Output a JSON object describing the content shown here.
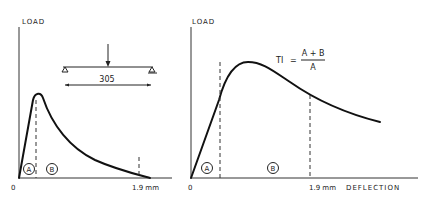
{
  "left_chart": {
    "y_label": "LOAD",
    "origin_label": "0",
    "x_tick_label": "1.9 mm",
    "region_a": "A",
    "region_b": "B",
    "beam": {
      "span_label": "305"
    }
  },
  "right_chart": {
    "y_label": "LOAD",
    "origin_label": "0",
    "x_tick_label": "1.9 mm",
    "x_label": "DEFLECTION",
    "region_a": "A",
    "region_b": "B",
    "formula": {
      "lhs": "TI",
      "equals": "=",
      "numerator": "A + B",
      "denominator": "A"
    }
  }
}
